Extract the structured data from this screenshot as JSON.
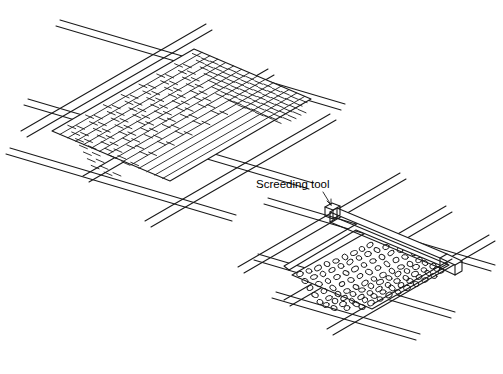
{
  "figure": {
    "title": "",
    "background_color": "#ffffff",
    "line_color": "#1a1a1a",
    "labels": [
      {
        "id": "screeding-tool",
        "text": "Screeding tool",
        "x": 256,
        "y": 188
      }
    ],
    "panels": [
      {
        "id": "upper-panel",
        "name": "brick-paving-grid",
        "description": "Isometric rectangular panel filled with running-bond brick pattern, supported on a lattice of crossing joists"
      },
      {
        "id": "lower-panel",
        "name": "gravel-bed-panel",
        "description": "Isometric rectangular panel filled with loose aggregate, with a screeding tool resting across the top edge rails"
      }
    ],
    "grid": {
      "upper_rails_count": 8,
      "lower_rails_count": 8
    },
    "brick_rows": 17,
    "aggregate_stones": 210
  }
}
